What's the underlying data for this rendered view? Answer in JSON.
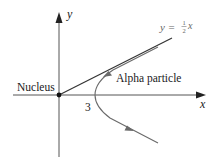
{
  "diagram": {
    "axes": {
      "x_label": "x",
      "y_label": "y"
    },
    "asymptote": {
      "eq_prefix": "y =",
      "frac_num": "1",
      "frac_den": "2",
      "eq_suffix": "x"
    },
    "labels": {
      "nucleus": "Nucleus",
      "alpha_particle": "Alpha particle",
      "vertex_x": "3"
    },
    "colors": {
      "axes": "#333333",
      "asymptote": "#333333",
      "trajectory": "#6a6a6a",
      "label_gray": "#666666"
    }
  }
}
